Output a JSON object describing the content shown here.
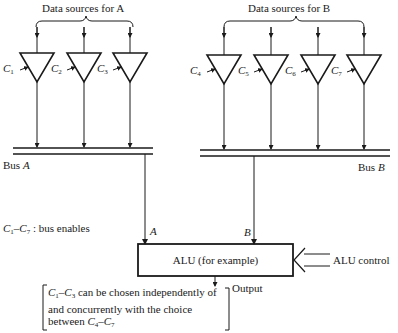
{
  "diagram": {
    "title_a": "Data sources for A",
    "title_b": "Data sources for B",
    "bus_a": {
      "label": "Bus",
      "name": "A"
    },
    "bus_b": {
      "label": "Bus",
      "name": "B"
    },
    "enables_a": [
      {
        "letter": "C",
        "sub": "1"
      },
      {
        "letter": "C",
        "sub": "2"
      },
      {
        "letter": "C",
        "sub": "3"
      }
    ],
    "enables_b": [
      {
        "letter": "C",
        "sub": "4"
      },
      {
        "letter": "C",
        "sub": "5"
      },
      {
        "letter": "C",
        "sub": "6"
      },
      {
        "letter": "C",
        "sub": "7"
      }
    ],
    "input_a_label": "A",
    "input_b_label": "B",
    "alu_label": "ALU (for example)",
    "alu_control_label": "ALU control",
    "output_label": "Output",
    "legend": {
      "from": "C",
      "from_sub": "1",
      "dash": "–",
      "to": "C",
      "to_sub": "7",
      "text": " : bus enables"
    },
    "note": {
      "part1_c": "C",
      "part1_sub": "1",
      "dash": "–",
      "part1_c2": "C",
      "part1_sub2": "3",
      "line1_rest": " can be chosen independently of and concurrently with the choice between ",
      "part2_c": "C",
      "part2_sub": "4",
      "part2_c2": "C",
      "part2_sub2": "7"
    },
    "colors": {
      "ink": "#1a1a1a",
      "background": "#ffffff"
    }
  }
}
